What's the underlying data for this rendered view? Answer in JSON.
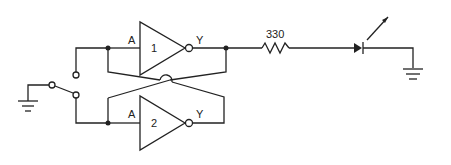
{
  "diagram": {
    "type": "circuit-schematic",
    "gates": [
      {
        "id": "1",
        "type": "inverter",
        "input_label": "A",
        "output_label": "Y"
      },
      {
        "id": "2",
        "type": "inverter",
        "input_label": "A",
        "output_label": "Y"
      }
    ],
    "resistor": {
      "label": "330"
    },
    "led": {
      "label": ""
    },
    "switch": {
      "type": "SPDT"
    },
    "grounds": 2
  },
  "labels": {
    "gate1_in": "A",
    "gate1_num": "1",
    "gate1_out": "Y",
    "gate2_in": "A",
    "gate2_num": "2",
    "gate2_out": "Y",
    "resistor": "330"
  },
  "colors": {
    "line": "#222222",
    "background": "#ffffff"
  }
}
